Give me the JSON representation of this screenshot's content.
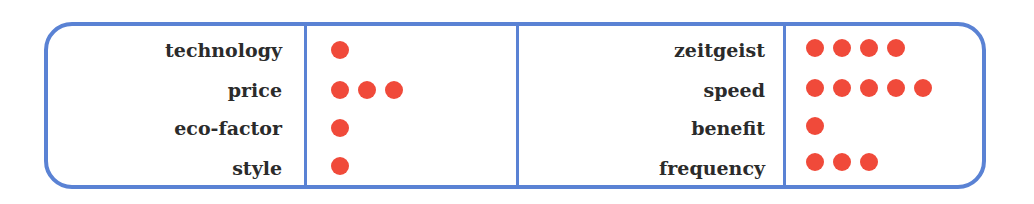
{
  "colors": {
    "border": "#5a82d4",
    "dot": "#f04a3a",
    "text": "#2b2b2b"
  },
  "chart_data": {
    "type": "table",
    "title": "",
    "groups": [
      {
        "rows": [
          {
            "label": "technology",
            "value": 1
          },
          {
            "label": "price",
            "value": 3
          },
          {
            "label": "eco-factor",
            "value": 1
          },
          {
            "label": "style",
            "value": 1
          }
        ]
      },
      {
        "rows": [
          {
            "label": "zeitgeist",
            "value": 4
          },
          {
            "label": "speed",
            "value": 5
          },
          {
            "label": "benefit",
            "value": 1
          },
          {
            "label": "frequency",
            "value": 3
          }
        ]
      }
    ]
  },
  "left": {
    "labels": [
      "technology",
      "price",
      "eco-factor",
      "style"
    ],
    "values": [
      1,
      3,
      1,
      1
    ]
  },
  "right": {
    "labels": [
      "zeitgeist",
      "speed",
      "benefit",
      "frequency"
    ],
    "values": [
      4,
      5,
      1,
      3
    ]
  }
}
